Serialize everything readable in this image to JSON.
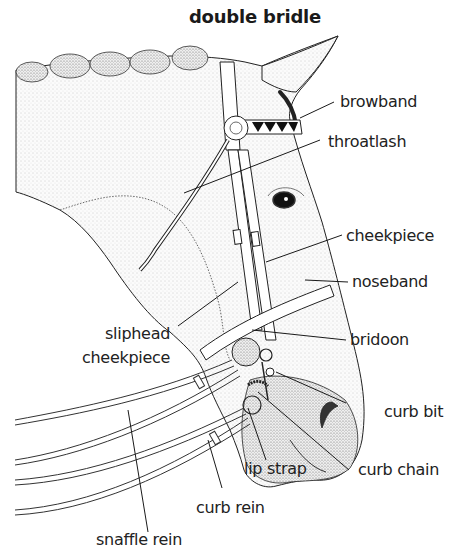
{
  "title": "double bridle",
  "labels": {
    "browband": "browband",
    "throatlash": "throatlash",
    "cheekpiece": "cheekpiece",
    "noseband": "noseband",
    "sliphead_line1": "sliphead",
    "sliphead_line2": "cheekpiece",
    "bridoon": "bridoon",
    "curb_bit": "curb bit",
    "lip_strap": "lip strap",
    "curb_chain": "curb chain",
    "curb_rein": "curb rein",
    "snaffle_rein": "snaffle rein"
  },
  "colors": {
    "ink": "#1a1a1a",
    "stipple": "#bdbdbd",
    "background": "#ffffff"
  }
}
